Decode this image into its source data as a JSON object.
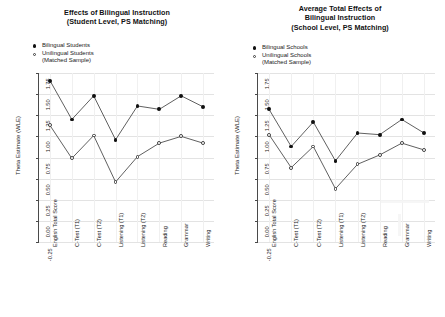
{
  "figure": {
    "background": "#ffffff",
    "series_colors": {
      "filled": "#111111",
      "open": "#ffffff",
      "open_stroke": "#3a3a3a"
    }
  },
  "panels": [
    {
      "id": "student-level",
      "title_lines": [
        "Effects of Bilingual Instruction",
        "(Student Level, PS Matching)"
      ],
      "legend": [
        {
          "marker": "filled",
          "label": "Bilingual Students",
          "sub": ""
        },
        {
          "marker": "open",
          "label": "Unilingual Students",
          "sub": "(Matched Sample)"
        }
      ],
      "chart_data": {
        "type": "line",
        "title": "Effects of Bilingual Instruction (Student Level, PS Matching)",
        "xlabel": "",
        "ylabel": "Theta Estimate (WLE)",
        "ylim": [
          -0.25,
          1.75
        ],
        "yticks": [
          "1.75",
          "1.50",
          "1.25",
          "1.00",
          "0.75",
          "0.50",
          "0.25",
          "0.00",
          "-0.25"
        ],
        "ytick_values": [
          1.75,
          1.5,
          1.25,
          1.0,
          0.75,
          0.5,
          0.25,
          0.0,
          -0.25
        ],
        "grid": true,
        "legend_position": "top-left",
        "categories": [
          "English Total Score",
          "C-Test (T1)",
          "C-Test (T2)",
          "Listening (T1)",
          "Listening (T2)",
          "Reading",
          "Grammar",
          "Writing"
        ],
        "series": [
          {
            "name": "Bilingual Students",
            "marker": "filled",
            "values": [
              1.66,
              1.2,
              1.48,
              0.96,
              1.36,
              1.32,
              1.48,
              1.35
            ]
          },
          {
            "name": "Unilingual Students (Matched Sample)",
            "marker": "open",
            "values": [
              1.13,
              0.74,
              1.01,
              0.46,
              0.76,
              0.92,
              1.0,
              0.92
            ]
          }
        ]
      }
    },
    {
      "id": "school-level",
      "title_lines": [
        "Average Total Effects of",
        "Bilingual Instruction",
        "(School Level, PS Matching)"
      ],
      "legend": [
        {
          "marker": "filled",
          "label": "Bilingual Schools",
          "sub": ""
        },
        {
          "marker": "open",
          "label": "Unilingual Schools",
          "sub": "(Matched Sample)"
        }
      ],
      "chart_data": {
        "type": "line",
        "title": "Average Total Effects of Bilingual Instruction (School Level, PS Matching)",
        "xlabel": "",
        "ylabel": "Theta Estimate (WLE)",
        "ylim": [
          -0.25,
          1.75
        ],
        "yticks": [
          "1.75",
          "1.50",
          "1.25",
          "1.00",
          "0.75",
          "0.50",
          "0.25",
          "0.00",
          "-0.25"
        ],
        "ytick_values": [
          1.75,
          1.5,
          1.25,
          1.0,
          0.75,
          0.5,
          0.25,
          0.0,
          -0.25
        ],
        "grid": true,
        "legend_position": "top-left",
        "categories": [
          "English Total Score",
          "C-Test (T1)",
          "C-Test (T2)",
          "Listening (T1)",
          "Listening (T2)",
          "Reading",
          "Grammar",
          "Writing"
        ],
        "series": [
          {
            "name": "Bilingual Schools",
            "marker": "filled",
            "values": [
              1.32,
              0.88,
              1.17,
              0.71,
              1.04,
              1.02,
              1.2,
              1.04
            ]
          },
          {
            "name": "Unilingual Schools (Matched Sample)",
            "marker": "open",
            "values": [
              1.02,
              0.63,
              0.88,
              0.38,
              0.67,
              0.78,
              0.92,
              0.84
            ]
          }
        ]
      }
    }
  ]
}
